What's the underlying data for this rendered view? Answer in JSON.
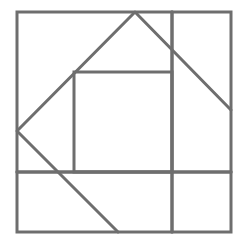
{
  "diagram": {
    "type": "geometric-sketch",
    "stroke_color": "#6e6e6e",
    "background": "#ffffff",
    "outer_square": {
      "x1": 17,
      "y1": 12,
      "x2": 231,
      "y2": 232
    },
    "inner_square": {
      "x1": 74,
      "y1": 72,
      "x2": 172,
      "y2": 172
    },
    "vertical_divider": {
      "x": 172,
      "y1": 12,
      "y2": 232
    },
    "horizontal_divider": {
      "y": 172,
      "x1": 17,
      "x2": 231
    },
    "tilted_polyline": [
      [
        118,
        232
      ],
      [
        17,
        131
      ],
      [
        135,
        12
      ],
      [
        231,
        110
      ]
    ]
  }
}
